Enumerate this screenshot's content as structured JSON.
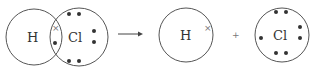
{
  "diagram": {
    "reactant": {
      "atoms": [
        {
          "symbol": "H",
          "cx": 34,
          "cy": 37,
          "r": 28
        },
        {
          "symbol": "Cl",
          "cx": 80,
          "cy": 37,
          "r": 29
        }
      ],
      "shared_electrons": [
        {
          "type": "cross",
          "x": 55,
          "y": 28
        },
        {
          "type": "dot",
          "x": 55,
          "y": 42
        }
      ],
      "cl_dots": [
        [
          69,
          14
        ],
        [
          79,
          14
        ],
        [
          69,
          61
        ],
        [
          79,
          61
        ],
        [
          94,
          31
        ],
        [
          94,
          42
        ]
      ]
    },
    "arrow": {
      "symbol": "→",
      "x1": 118,
      "x2": 143,
      "y": 34
    },
    "products": [
      {
        "symbol": "H",
        "cx": 186,
        "cy": 35,
        "r": 27,
        "electrons": [
          {
            "type": "cross",
            "x": 207,
            "y": 27
          }
        ]
      },
      {
        "symbol": "Cl",
        "cx": 282,
        "cy": 35,
        "r": 27,
        "electrons": [
          {
            "type": "dot",
            "x": 276,
            "y": 12
          },
          {
            "type": "dot",
            "x": 286,
            "y": 12
          },
          {
            "type": "dot",
            "x": 276,
            "y": 53
          },
          {
            "type": "dot",
            "x": 286,
            "y": 53
          },
          {
            "type": "dot",
            "x": 300,
            "y": 27
          },
          {
            "type": "dot",
            "x": 300,
            "y": 38
          },
          {
            "type": "dot",
            "x": 261,
            "y": 38
          }
        ]
      }
    ],
    "plus": "+",
    "labels": {
      "h1": "H",
      "cl1": "Cl",
      "h2": "H",
      "cl2": "Cl",
      "cross": "×"
    }
  }
}
